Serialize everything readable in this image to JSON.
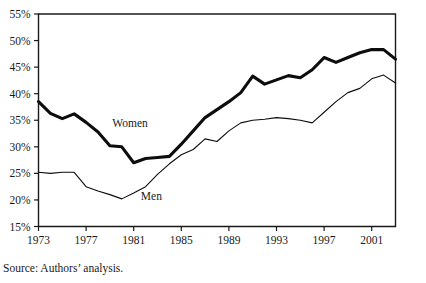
{
  "source_note": "Source: Authors’ analysis.",
  "labels": {
    "women": "Women",
    "men": "Men"
  },
  "chart_data": {
    "type": "line",
    "title": "",
    "subtitle": "",
    "xlabel": "",
    "ylabel": "",
    "xlim": [
      1973,
      2003
    ],
    "ylim": [
      15,
      55
    ],
    "grid": false,
    "legend_position": "inline-annotation",
    "x_tick_labels": [
      "1973",
      "1977",
      "1981",
      "1985",
      "1989",
      "1993",
      "1997",
      "2001"
    ],
    "x_ticks": [
      1973,
      1977,
      1981,
      1985,
      1989,
      1993,
      1997,
      2001
    ],
    "y_tick_labels": [
      "15%",
      "20%",
      "25%",
      "30%",
      "35%",
      "40%",
      "45%",
      "50%",
      "55%"
    ],
    "y_ticks": [
      15,
      20,
      25,
      30,
      35,
      40,
      45,
      50,
      55
    ],
    "value_suffix": "%",
    "x": [
      1973,
      1974,
      1975,
      1976,
      1977,
      1978,
      1979,
      1980,
      1981,
      1982,
      1983,
      1984,
      1985,
      1986,
      1987,
      1988,
      1989,
      1990,
      1991,
      1992,
      1993,
      1994,
      1995,
      1996,
      1997,
      1998,
      1999,
      2000,
      2001,
      2002,
      2003
    ],
    "series": [
      {
        "name": "Women",
        "style": "thick",
        "color": "#0d0d0d",
        "annotation": "Women",
        "values": [
          38.5,
          36.3,
          35.3,
          36.2,
          34.6,
          32.8,
          30.2,
          30.0,
          27.0,
          27.8,
          28.0,
          28.2,
          30.5,
          33.0,
          35.5,
          37.0,
          38.5,
          40.2,
          43.3,
          41.8,
          42.6,
          43.4,
          43.0,
          44.5,
          46.8,
          45.9,
          46.8,
          47.7,
          48.3,
          48.3,
          46.5
        ]
      },
      {
        "name": "Men",
        "style": "thin",
        "color": "#0d0d0d",
        "annotation": "Men",
        "values": [
          25.2,
          25.0,
          25.2,
          25.2,
          22.5,
          21.7,
          21.0,
          20.2,
          21.3,
          22.5,
          24.8,
          26.8,
          28.5,
          29.5,
          31.5,
          31.0,
          33.0,
          34.5,
          35.0,
          35.2,
          35.5,
          35.3,
          35.0,
          34.5,
          36.5,
          38.5,
          40.2,
          41.0,
          42.8,
          43.5,
          42.0
        ]
      }
    ],
    "annotations": [
      {
        "text": "Women",
        "x": 1979.2,
        "y": 33.8
      },
      {
        "text": "Men",
        "x": 1981.6,
        "y": 20.0
      }
    ]
  }
}
